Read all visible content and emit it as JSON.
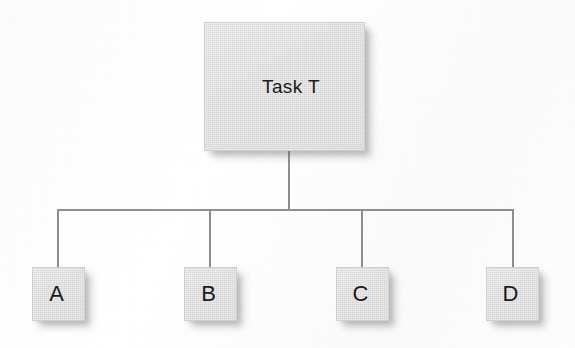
{
  "diagram": {
    "type": "tree",
    "orientation": "top-down",
    "background_color": "#fdfdfd",
    "node_fill_color": "#dedede",
    "node_border_color": "#cfcfcf",
    "line_color": "#8e8e8e",
    "text_color": "#1b1b1b",
    "root": {
      "id": "root",
      "label": "Task T"
    },
    "children": [
      {
        "id": "a",
        "label": "A"
      },
      {
        "id": "b",
        "label": "B"
      },
      {
        "id": "c",
        "label": "C"
      },
      {
        "id": "d",
        "label": "D"
      }
    ],
    "edges": [
      {
        "from": "root",
        "to": "a"
      },
      {
        "from": "root",
        "to": "b"
      },
      {
        "from": "root",
        "to": "c"
      },
      {
        "from": "root",
        "to": "d"
      }
    ]
  }
}
